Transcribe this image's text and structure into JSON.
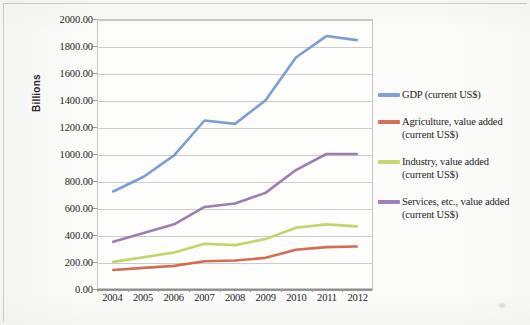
{
  "chart_data": {
    "type": "line",
    "title": "",
    "subtitle": "",
    "xlabel": "",
    "ylabel": "Billions",
    "categories": [
      "2004",
      "2005",
      "2006",
      "2007",
      "2008",
      "2009",
      "2010",
      "2011",
      "2012"
    ],
    "x": [
      2004,
      2005,
      2006,
      2007,
      2008,
      2009,
      2010,
      2011,
      2012
    ],
    "ylim": [
      0,
      2000
    ],
    "ytick_labels": [
      "0.00",
      "200.00",
      "400.00",
      "600.00",
      "800.00",
      "1000.00",
      "1200.00",
      "1400.00",
      "1600.00",
      "1800.00",
      "2000.00"
    ],
    "ytick_values": [
      0,
      200,
      400,
      600,
      800,
      1000,
      1200,
      1400,
      1600,
      1800,
      2000
    ],
    "grid": true,
    "legend_position": "right",
    "series": [
      {
        "name": "GDP (current US$)",
        "color": "#7198cd",
        "values": [
          720,
          830,
          990,
          1250,
          1225,
          1400,
          1720,
          1880,
          1850
        ]
      },
      {
        "name": "Agriculture, value added (current US$)",
        "color": "#cf6249",
        "values": [
          135,
          150,
          165,
          200,
          205,
          225,
          285,
          305,
          310
        ]
      },
      {
        "name": "Industry, value added (current US$)",
        "color": "#bcd25f",
        "values": [
          195,
          230,
          265,
          330,
          320,
          365,
          450,
          475,
          460
        ]
      },
      {
        "name": "Services, etc., value added (current US$)",
        "color": "#9474ad",
        "values": [
          345,
          410,
          475,
          605,
          630,
          710,
          880,
          1000,
          1000
        ]
      }
    ]
  },
  "legend": {
    "items": [
      {
        "label": "GDP (current US$)",
        "color": "#7198cd"
      },
      {
        "label": "Agriculture, value added (current US$)",
        "color": "#cf6249"
      },
      {
        "label": "Industry, value added (current US$)",
        "color": "#bcd25f"
      },
      {
        "label": "Services, etc., value added (current US$)",
        "color": "#9474ad"
      }
    ]
  },
  "axis": {
    "y_title": "Billions"
  }
}
